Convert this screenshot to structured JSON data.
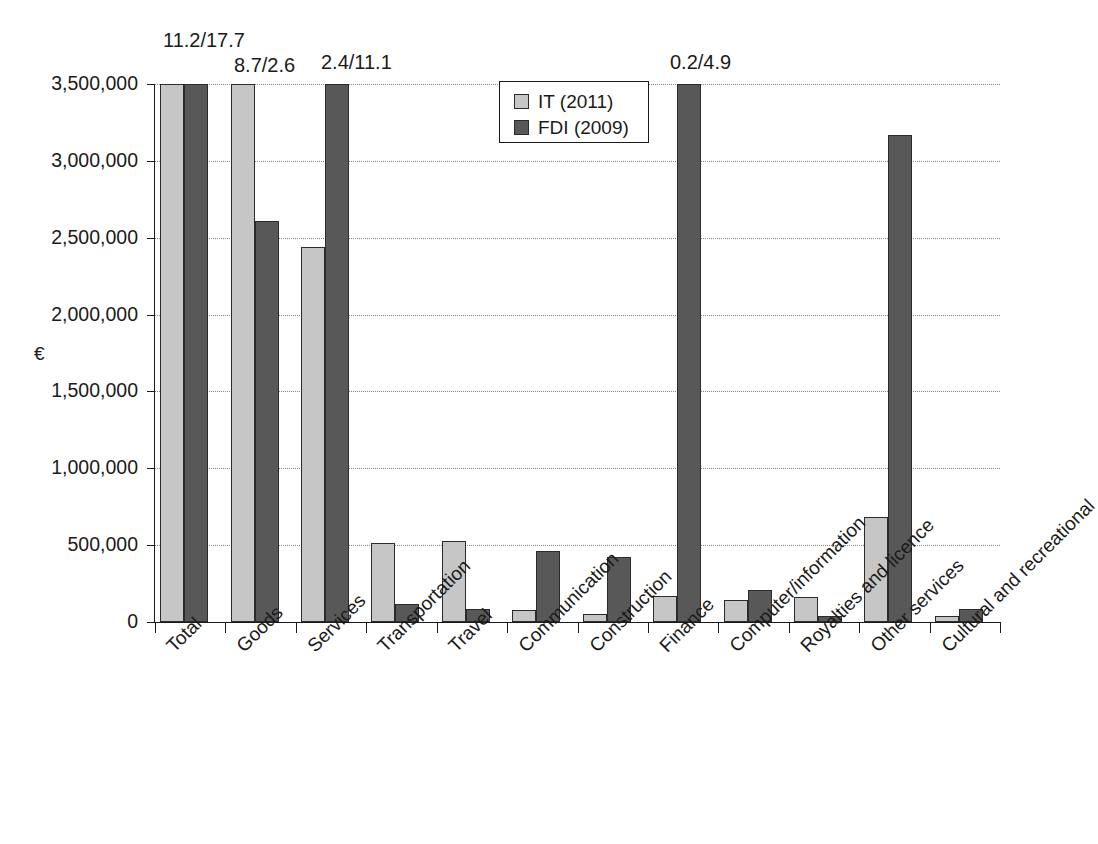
{
  "chart_data": {
    "type": "bar",
    "title": "",
    "subtitle": "",
    "xlabel": "",
    "ylabel": "€",
    "ylim": [
      0,
      3500000
    ],
    "ytick_values": [
      0,
      500000,
      1000000,
      1500000,
      2000000,
      2500000,
      3000000,
      3500000
    ],
    "ytick_labels": [
      "0",
      "500,000",
      "1,000,000",
      "1,500,000",
      "2,000,000",
      "2,500,000",
      "3,000,000",
      "3,500,000"
    ],
    "grid": true,
    "grid_axis": "y",
    "legend_position": "upper-center",
    "categories": [
      "Total",
      "Goods",
      "Services",
      "Transportation",
      "Travel",
      "Communication",
      "Construction",
      "Finance",
      "Computer/information",
      "Royalties and licence",
      "Other services",
      "Cultural and recreational"
    ],
    "series": [
      {
        "name": "IT (2011)",
        "color": "#c6c6c6",
        "values": [
          3500000,
          3500000,
          2440000,
          515000,
          525000,
          80000,
          55000,
          170000,
          140000,
          160000,
          680000,
          40000
        ],
        "clipped": [
          true,
          true,
          false,
          false,
          false,
          false,
          false,
          false,
          false,
          false,
          false,
          false
        ]
      },
      {
        "name": "FDI (2009)",
        "color": "#585858",
        "values": [
          3500000,
          2610000,
          3500000,
          120000,
          85000,
          460000,
          420000,
          3500000,
          210000,
          38000,
          3170000,
          85000
        ],
        "clipped": [
          true,
          false,
          true,
          false,
          false,
          false,
          false,
          true,
          false,
          false,
          false,
          false
        ]
      }
    ],
    "annotations": [
      {
        "text": "11.2/17.7",
        "category": "Total",
        "x_px": 163,
        "y_px": 30
      },
      {
        "text": "8.7/2.6",
        "category": "Goods",
        "x_px": 234,
        "y_px": 55
      },
      {
        "text": "2.4/11.1",
        "category": "Services",
        "x_px": 321,
        "y_px": 52
      },
      {
        "text": "0.2/4.9",
        "category": "Finance",
        "x_px": 670,
        "y_px": 52
      }
    ]
  },
  "legend": {
    "entries": [
      {
        "label": "IT (2011)",
        "series_key": "it"
      },
      {
        "label": "FDI (2009)",
        "series_key": "fdi"
      }
    ]
  },
  "axis": {
    "y_title": "€"
  }
}
